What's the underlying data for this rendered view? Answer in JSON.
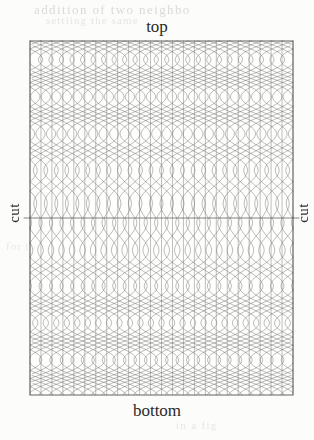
{
  "figure": {
    "labels": {
      "top": "top",
      "bottom": "bottom",
      "cut_left": "cut",
      "cut_right": "cut"
    },
    "ghost_text": {
      "top_line1": "addition of two neighbo",
      "top_line2": "settling the same",
      "middle": "for th",
      "bottom": "in a fig"
    },
    "colors": {
      "paper": "#fcfcfb",
      "ink": "#2a2a2a",
      "lattice_line": "#6f6f6f",
      "border": "#555555",
      "cut_line": "#5a5a5a",
      "ghost": "#cfcfcd"
    },
    "geometry": {
      "left": 30,
      "right": 293,
      "top": 41,
      "bottom": 395,
      "cut_y": 218,
      "vertical_line_count": 25,
      "wave_wavelength_px": 75,
      "wave_max_amplitude_px": 34,
      "stroke_width": 0.55
    },
    "chart_data": {
      "type": "line",
      "title": "",
      "description": "Woven lattice pattern: vertical warp lines crossed by two mirrored families of sinusoidal curves whose amplitude decays to zero at the central horizontal cut line.",
      "xlabel": "",
      "ylabel": "",
      "xlim": [
        30,
        293
      ],
      "ylim": [
        41,
        395
      ],
      "grid": false,
      "legend": "none",
      "annotations": [
        "top",
        "bottom",
        "cut",
        "cut"
      ],
      "series": [
        {
          "name": "vertical-warp-lines",
          "count": 25,
          "kind": "straight-vertical"
        },
        {
          "name": "wave-family-rightward",
          "count": 26,
          "kind": "sinusoid",
          "phase": 0
        },
        {
          "name": "wave-family-leftward",
          "count": 26,
          "kind": "sinusoid",
          "phase": 3.14159
        },
        {
          "name": "cut-line",
          "count": 1,
          "kind": "horizontal",
          "y": 218
        }
      ]
    }
  }
}
